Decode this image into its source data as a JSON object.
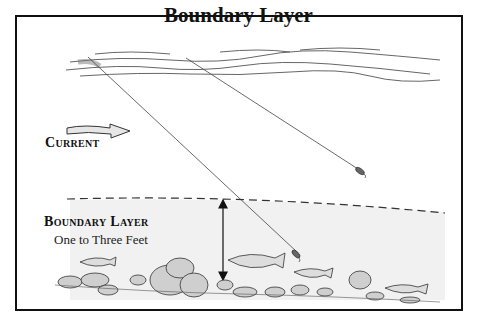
{
  "diagram": {
    "title": "Boundary Layer",
    "labels": {
      "current": "Current",
      "boundary_layer": "Boundary Layer",
      "depth": "One to Three Feet"
    },
    "elements": [
      "water-surface",
      "current-arrow",
      "fishing-line-1",
      "fishing-line-2",
      "lure-1",
      "lure-2",
      "boundary-dashed-line",
      "depth-double-arrow",
      "riverbed-rocks",
      "fish"
    ],
    "colors": {
      "frame": "#111111",
      "ink": "#222222",
      "shade": "#d8d8d8"
    }
  }
}
